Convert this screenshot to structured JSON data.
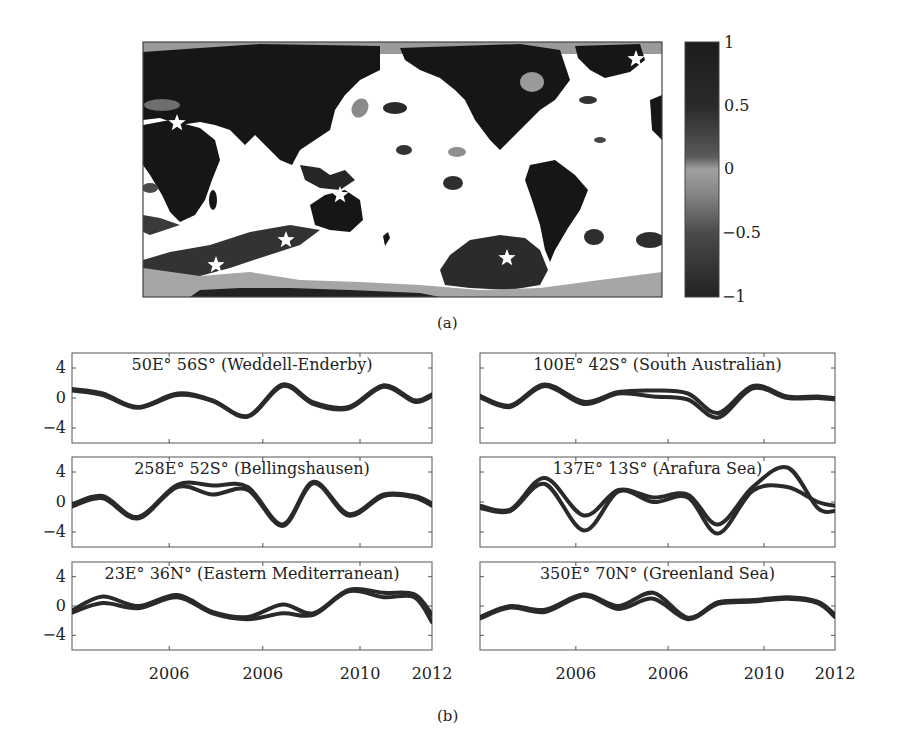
{
  "figure": {
    "panel_a_label": "(a)",
    "panel_b_label": "(b)"
  },
  "colorbar": {
    "ticks": [
      "1",
      "0.5",
      "0",
      "−0.5",
      "−1"
    ],
    "range": [
      -1,
      1
    ]
  },
  "map": {
    "stars": [
      {
        "name": "Weddell-Enderby",
        "x": 216,
        "y": 265
      },
      {
        "name": "South Australian",
        "x": 286,
        "y": 240
      },
      {
        "name": "Bellingshausen",
        "x": 507,
        "y": 258
      },
      {
        "name": "Arafura Sea",
        "x": 340,
        "y": 195
      },
      {
        "name": "Eastern Mediterranean",
        "x": 177,
        "y": 123
      },
      {
        "name": "Greenland Sea",
        "x": 636,
        "y": 59
      }
    ]
  },
  "chart_data": [
    {
      "type": "heatmap",
      "title": "",
      "description": "Global correlation map (grayscale), land masked dark, stars at six sample locations",
      "colorbar": {
        "min": -1,
        "max": 1,
        "ticks": [
          1,
          0.5,
          0,
          -0.5,
          -1
        ]
      }
    },
    {
      "type": "line",
      "title": "50E° 56S° (Weddell-Enderby)",
      "xlabel": "",
      "ylabel": "",
      "ylim": [
        -6,
        6
      ],
      "yticks": [
        4,
        0,
        -4
      ],
      "xticks": [
        "2006",
        "2006",
        "2010",
        "2012"
      ],
      "x": [
        2003.8,
        2004.5,
        2005.3,
        2006.2,
        2007,
        2007.8,
        2008.6,
        2009.3,
        2010.1,
        2010.9,
        2011.6,
        2012
      ],
      "series": [
        {
          "name": "s1",
          "values": [
            1.2,
            0.6,
            -1.2,
            0.6,
            -0.3,
            -2.4,
            1.8,
            -0.6,
            -1.2,
            1.7,
            -0.3,
            0.5
          ]
        },
        {
          "name": "s2",
          "values": [
            1.0,
            0.4,
            -1.3,
            0.4,
            -0.4,
            -2.5,
            1.6,
            -0.8,
            -1.4,
            1.5,
            -0.5,
            0.3
          ]
        }
      ]
    },
    {
      "type": "line",
      "title": "100E° 42S° (South Australian)",
      "ylim": [
        -6,
        6
      ],
      "yticks": [
        4,
        0,
        -4
      ],
      "xticks": [
        "2006",
        "2006",
        "2010",
        "2012"
      ],
      "x": [
        2003.8,
        2004.5,
        2005.3,
        2006.2,
        2007,
        2007.8,
        2008.6,
        2009.3,
        2010.1,
        2010.9,
        2011.6,
        2012
      ],
      "series": [
        {
          "name": "s1",
          "values": [
            0.3,
            -1.0,
            1.8,
            -0.5,
            0.8,
            1.0,
            0.6,
            -2.0,
            1.6,
            0.2,
            0.2,
            0.0
          ]
        },
        {
          "name": "s2",
          "values": [
            0.1,
            -1.2,
            1.6,
            -0.8,
            0.6,
            0.2,
            -0.2,
            -2.6,
            1.3,
            0.0,
            0.0,
            -0.2
          ]
        }
      ]
    },
    {
      "type": "line",
      "title": "258E° 52S° (Bellingshausen)",
      "ylim": [
        -6,
        6
      ],
      "yticks": [
        4,
        0,
        -4
      ],
      "xticks": [
        "2006",
        "2006",
        "2010",
        "2012"
      ],
      "x": [
        2003.8,
        2004.5,
        2005.3,
        2006.2,
        2007,
        2007.8,
        2008.6,
        2009.3,
        2010.1,
        2010.9,
        2011.6,
        2012
      ],
      "series": [
        {
          "name": "s1",
          "values": [
            -0.3,
            0.8,
            -2.0,
            2.3,
            2.2,
            2.0,
            -3.0,
            2.7,
            -1.6,
            1.0,
            0.8,
            -0.2
          ]
        },
        {
          "name": "s2",
          "values": [
            -0.6,
            0.5,
            -2.2,
            2.0,
            1.0,
            1.6,
            -3.2,
            2.5,
            -1.8,
            0.8,
            0.6,
            -0.5
          ]
        }
      ]
    },
    {
      "type": "line",
      "title": "137E° 13S° (Arafura Sea)",
      "ylim": [
        -6,
        6
      ],
      "yticks": [
        4,
        0,
        -4
      ],
      "xticks": [
        "2006",
        "2006",
        "2010",
        "2012"
      ],
      "x": [
        2003.8,
        2004.5,
        2005.3,
        2006.2,
        2007,
        2007.8,
        2008.6,
        2009.3,
        2010.1,
        2010.9,
        2011.6,
        2012
      ],
      "series": [
        {
          "name": "s1",
          "values": [
            -0.5,
            -1.0,
            3.2,
            -1.8,
            1.6,
            0.6,
            1.0,
            -3.0,
            2.0,
            4.6,
            -0.8,
            -1.2
          ]
        },
        {
          "name": "s2",
          "values": [
            -0.8,
            -1.2,
            2.4,
            -3.8,
            1.4,
            0.0,
            0.6,
            -4.2,
            1.5,
            2.0,
            0.0,
            -0.5
          ]
        }
      ]
    },
    {
      "type": "line",
      "title": "23E° 36N° (Eastern Mediterranean)",
      "ylim": [
        -6,
        6
      ],
      "yticks": [
        4,
        0,
        -4
      ],
      "xticks": [
        "2006",
        "2006",
        "2010",
        "2012"
      ],
      "x": [
        2003.8,
        2004.5,
        2005.3,
        2006.2,
        2007,
        2007.8,
        2008.6,
        2009.3,
        2010.1,
        2010.9,
        2011.6,
        2012
      ],
      "series": [
        {
          "name": "s1",
          "values": [
            -0.6,
            1.3,
            0.0,
            1.5,
            -0.8,
            -1.5,
            0.2,
            -1.0,
            2.2,
            1.8,
            1.6,
            -1.2
          ]
        },
        {
          "name": "s2",
          "values": [
            -0.9,
            0.4,
            -0.3,
            1.2,
            -1.0,
            -1.8,
            -1.0,
            -1.2,
            2.0,
            1.2,
            1.2,
            -2.2
          ]
        }
      ]
    },
    {
      "type": "line",
      "title": "350E° 70N° (Greenland Sea)",
      "ylim": [
        -6,
        6
      ],
      "yticks": [
        4,
        0,
        -4
      ],
      "xticks": [
        "2006",
        "2006",
        "2010",
        "2012"
      ],
      "x": [
        2003.8,
        2004.5,
        2005.3,
        2006.2,
        2007,
        2007.8,
        2008.6,
        2009.3,
        2010.1,
        2010.9,
        2011.6,
        2012
      ],
      "series": [
        {
          "name": "s1",
          "values": [
            -1.5,
            0.0,
            -0.5,
            1.6,
            0.0,
            1.8,
            -1.6,
            0.5,
            0.8,
            1.2,
            0.6,
            -1.2
          ]
        },
        {
          "name": "s2",
          "values": [
            -1.7,
            -0.2,
            -0.8,
            1.4,
            -0.4,
            1.0,
            -1.8,
            0.3,
            0.6,
            1.0,
            0.4,
            -1.5
          ]
        }
      ]
    }
  ],
  "subplots": [
    {
      "title": "50E° 56S° (Weddell-Enderby)"
    },
    {
      "title": "100E° 42S° (South Australian)"
    },
    {
      "title": "258E° 52S° (Bellingshausen)"
    },
    {
      "title": "137E° 13S° (Arafura Sea)"
    },
    {
      "title": "23E° 36N° (Eastern Mediterranean)"
    },
    {
      "title": "350E° 70N° (Greenland Sea)"
    }
  ],
  "axes": {
    "yticks": [
      "4",
      "0",
      "−4"
    ],
    "xticks": [
      "2006",
      "2006",
      "2010",
      "2012"
    ]
  }
}
